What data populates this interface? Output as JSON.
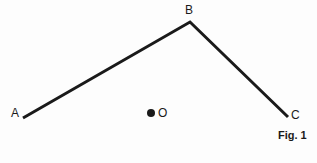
{
  "figure": {
    "caption": "Fig. 1",
    "background_color": "#fdfdfd",
    "stroke_color": "#1a1a1a",
    "stroke_width": 3,
    "labels": {
      "a": "A",
      "b": "B",
      "c": "C",
      "o": "O"
    },
    "points": {
      "a": {
        "x": 23,
        "y": 118
      },
      "b": {
        "x": 190,
        "y": 22
      },
      "c": {
        "x": 288,
        "y": 117
      },
      "o": {
        "x": 151,
        "y": 113
      }
    },
    "polyline": "23,118 190,22 288,117"
  }
}
